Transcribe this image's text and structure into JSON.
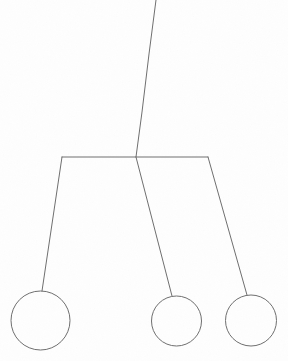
{
  "figure": {
    "name": "hanging-mobile-diagram",
    "background_color": "#fefefe",
    "stroke_color": "#6e6e6e",
    "stroke_width": 1,
    "width": 288,
    "height": 361
  },
  "chart_data": {
    "type": "diagram",
    "title": "",
    "subtitle": "",
    "xlabel": "",
    "ylabel": "",
    "grid": false,
    "legend": "none",
    "coordinate_space": {
      "origin": "top-left",
      "xlim": [
        0,
        288
      ],
      "ylim": [
        0,
        361
      ],
      "units": "pixels"
    },
    "nodes": [
      {
        "id": "suspension-top",
        "label": "",
        "kind": "anchor",
        "x": 156,
        "y": 0
      },
      {
        "id": "crossbar-junction",
        "label": "",
        "kind": "junction",
        "x": 136,
        "y": 157
      },
      {
        "id": "crossbar-left-end",
        "label": "",
        "kind": "corner",
        "x": 62,
        "y": 157
      },
      {
        "id": "crossbar-right-end",
        "label": "",
        "kind": "corner",
        "x": 208,
        "y": 157
      },
      {
        "id": "circle-left",
        "label": "",
        "kind": "circle",
        "x": 40.5,
        "y": 320.5,
        "r": 29.5
      },
      {
        "id": "circle-middle",
        "label": "",
        "kind": "circle",
        "x": 176.5,
        "y": 321,
        "r": 25
      },
      {
        "id": "circle-right",
        "label": "",
        "kind": "circle",
        "x": 251,
        "y": 320.5,
        "r": 25.5
      }
    ],
    "edges": [
      {
        "id": "suspension-stem",
        "from": "suspension-top",
        "to": "crossbar-junction",
        "points": [
          [
            156,
            0
          ],
          [
            149,
            54
          ],
          [
            142,
            112
          ],
          [
            136,
            157
          ]
        ]
      },
      {
        "id": "crossbar",
        "from": "crossbar-left-end",
        "to": "crossbar-right-end",
        "points": [
          [
            62,
            157
          ],
          [
            208,
            157
          ]
        ]
      },
      {
        "id": "string-left",
        "from": "crossbar-left-end",
        "to": "circle-left",
        "points": [
          [
            62,
            157
          ],
          [
            42,
            291
          ]
        ]
      },
      {
        "id": "string-middle",
        "from": "crossbar-junction",
        "to": "circle-middle",
        "points": [
          [
            136,
            157
          ],
          [
            172,
            296
          ]
        ]
      },
      {
        "id": "string-right",
        "from": "crossbar-right-end",
        "to": "circle-right",
        "points": [
          [
            208,
            157
          ],
          [
            247,
            295
          ]
        ]
      }
    ],
    "annotations": []
  },
  "caption": {
    "text": "",
    "visible": false,
    "top": 354
  }
}
